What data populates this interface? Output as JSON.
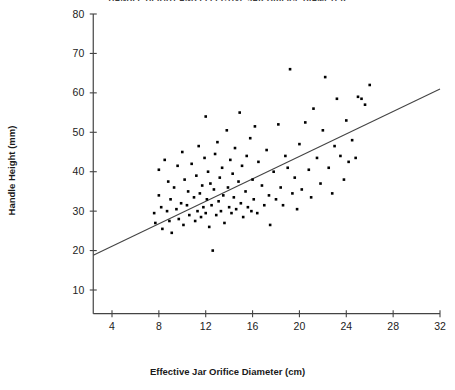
{
  "chart_data": {
    "type": "scatter",
    "title": "HANDLE HEIGHT AND EFFECTIVE JAR ORIFICE DIAMETER",
    "xlabel": "Effective Jar Orifice Diameter (cm)",
    "ylabel": "Handle Height (mm)",
    "xlim": [
      2.4,
      32.0
    ],
    "ylim": [
      4.0,
      80.0
    ],
    "xticks": [
      4,
      8,
      12,
      16,
      20,
      24,
      28,
      32
    ],
    "yticks": [
      10,
      20,
      30,
      40,
      50,
      60,
      70,
      80
    ],
    "xticklabels": [
      "4",
      "8",
      "12",
      "16",
      "20",
      "24",
      "28",
      "32"
    ],
    "yticklabels": [
      "10",
      "20",
      "30",
      "40",
      "50",
      "60",
      "70",
      "80"
    ],
    "grid": false,
    "legend": null,
    "marker": "square",
    "marker_color": "#000000",
    "line_color": "#444444",
    "axis_color": "#444444",
    "trendline": {
      "type": "line",
      "x": [
        2.4,
        32.0
      ],
      "y": [
        18.8,
        61.0
      ]
    },
    "points": [
      [
        7.6,
        29.5
      ],
      [
        7.7,
        27.0
      ],
      [
        8.0,
        34.0
      ],
      [
        8.0,
        40.5
      ],
      [
        8.2,
        31.0
      ],
      [
        8.3,
        25.5
      ],
      [
        8.5,
        43.0
      ],
      [
        8.7,
        30.0
      ],
      [
        8.8,
        37.5
      ],
      [
        8.9,
        27.5
      ],
      [
        9.0,
        33.0
      ],
      [
        9.1,
        24.5
      ],
      [
        9.3,
        36.0
      ],
      [
        9.5,
        30.5
      ],
      [
        9.6,
        41.5
      ],
      [
        9.7,
        28.0
      ],
      [
        9.9,
        32.0
      ],
      [
        10.0,
        45.0
      ],
      [
        10.1,
        26.5
      ],
      [
        10.2,
        38.0
      ],
      [
        10.4,
        31.5
      ],
      [
        10.5,
        35.0
      ],
      [
        10.6,
        29.0
      ],
      [
        10.8,
        42.0
      ],
      [
        11.0,
        33.5
      ],
      [
        11.1,
        27.5
      ],
      [
        11.2,
        39.0
      ],
      [
        11.3,
        30.0
      ],
      [
        11.4,
        46.5
      ],
      [
        11.5,
        34.5
      ],
      [
        11.6,
        28.5
      ],
      [
        11.7,
        36.5
      ],
      [
        11.8,
        31.0
      ],
      [
        11.9,
        43.5
      ],
      [
        12.0,
        29.5
      ],
      [
        12.0,
        54.0
      ],
      [
        12.1,
        33.0
      ],
      [
        12.2,
        40.0
      ],
      [
        12.3,
        26.0
      ],
      [
        12.4,
        37.0
      ],
      [
        12.5,
        31.5
      ],
      [
        12.6,
        20.0
      ],
      [
        12.7,
        35.5
      ],
      [
        12.8,
        44.5
      ],
      [
        12.9,
        29.0
      ],
      [
        13.0,
        47.5
      ],
      [
        13.1,
        32.5
      ],
      [
        13.2,
        38.5
      ],
      [
        13.3,
        30.0
      ],
      [
        13.4,
        41.0
      ],
      [
        13.5,
        34.0
      ],
      [
        13.6,
        27.0
      ],
      [
        13.8,
        50.5
      ],
      [
        13.9,
        36.0
      ],
      [
        14.0,
        31.0
      ],
      [
        14.1,
        43.0
      ],
      [
        14.2,
        29.5
      ],
      [
        14.3,
        39.5
      ],
      [
        14.4,
        33.5
      ],
      [
        14.5,
        46.0
      ],
      [
        14.6,
        30.5
      ],
      [
        14.8,
        37.5
      ],
      [
        14.9,
        55.0
      ],
      [
        15.0,
        32.0
      ],
      [
        15.1,
        41.5
      ],
      [
        15.2,
        28.5
      ],
      [
        15.4,
        35.0
      ],
      [
        15.5,
        44.0
      ],
      [
        15.6,
        31.0
      ],
      [
        15.8,
        48.5
      ],
      [
        15.9,
        30.0
      ],
      [
        16.0,
        38.0
      ],
      [
        16.1,
        33.0
      ],
      [
        16.2,
        51.5
      ],
      [
        16.4,
        29.5
      ],
      [
        16.5,
        42.5
      ],
      [
        16.8,
        36.5
      ],
      [
        17.0,
        31.5
      ],
      [
        17.2,
        45.5
      ],
      [
        17.4,
        34.0
      ],
      [
        17.5,
        26.5
      ],
      [
        17.8,
        40.0
      ],
      [
        18.0,
        33.0
      ],
      [
        18.2,
        52.0
      ],
      [
        18.4,
        36.0
      ],
      [
        18.6,
        31.5
      ],
      [
        18.8,
        44.0
      ],
      [
        19.0,
        41.0
      ],
      [
        19.2,
        66.0
      ],
      [
        19.4,
        34.5
      ],
      [
        19.6,
        38.5
      ],
      [
        19.8,
        30.5
      ],
      [
        20.0,
        47.0
      ],
      [
        20.2,
        35.5
      ],
      [
        20.5,
        52.5
      ],
      [
        20.8,
        40.5
      ],
      [
        21.0,
        33.5
      ],
      [
        21.2,
        56.0
      ],
      [
        21.5,
        43.5
      ],
      [
        21.8,
        37.0
      ],
      [
        22.0,
        50.5
      ],
      [
        22.2,
        64.0
      ],
      [
        22.5,
        41.0
      ],
      [
        22.8,
        34.5
      ],
      [
        23.0,
        46.5
      ],
      [
        23.2,
        58.5
      ],
      [
        23.5,
        44.0
      ],
      [
        23.8,
        38.0
      ],
      [
        24.0,
        53.0
      ],
      [
        24.2,
        42.5
      ],
      [
        24.5,
        48.0
      ],
      [
        24.8,
        43.5
      ],
      [
        25.0,
        59.0
      ],
      [
        25.3,
        58.5
      ],
      [
        25.6,
        57.0
      ],
      [
        26.0,
        62.0
      ]
    ]
  }
}
